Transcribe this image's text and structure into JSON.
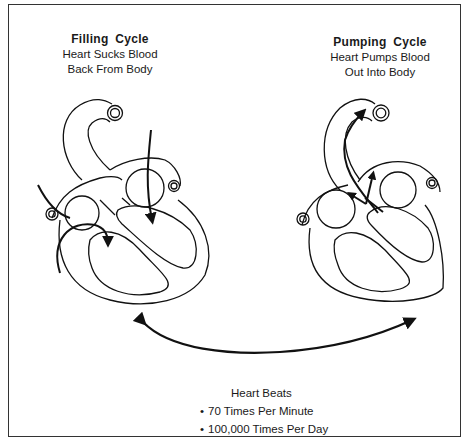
{
  "filling_cycle": {
    "title": "Filling  Cycle",
    "line1": "Heart Sucks Blood",
    "line2": "Back From Body"
  },
  "pumping_cycle": {
    "title": "Pumping  Cycle",
    "line1": "Heart Pumps Blood",
    "line2": "Out Into Body"
  },
  "heart_beats": {
    "heading": "Heart Beats",
    "items": [
      "70 Times Per Minute",
      "100,000 Times Per Day"
    ]
  },
  "icons": {
    "left_heart": "heart-filling-diagram",
    "right_heart": "heart-pumping-diagram",
    "cycle_arrow": "double-headed-curved-arrow"
  },
  "colors": {
    "line": "#1a1a1a",
    "background": "#ffffff",
    "frame": "#333333"
  }
}
